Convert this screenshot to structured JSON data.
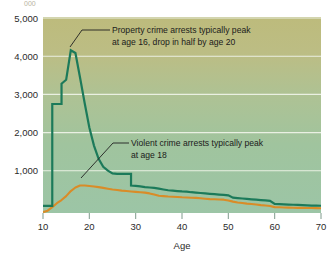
{
  "chart_data": {
    "type": "line",
    "title": "",
    "xlabel": "Age",
    "ylabel": "",
    "xlim": [
      10,
      70
    ],
    "ylim": [
      0,
      5000
    ],
    "grid": true,
    "legend": "none",
    "x_ticks": [
      "10",
      "20",
      "30",
      "40",
      "50",
      "60",
      "70"
    ],
    "y_ticks": [
      "1,000",
      "2,000",
      "3,000",
      "4,000",
      "5,000"
    ],
    "series": [
      {
        "name": "Property crime arrests",
        "color": "#1c7a5a",
        "x": [
          10,
          11,
          12,
          12,
          13,
          14,
          14,
          15,
          16,
          17,
          18,
          19,
          20,
          21,
          22,
          23,
          24,
          25,
          26,
          27,
          28,
          29,
          29,
          30,
          31,
          32,
          33,
          34,
          35,
          36,
          37,
          38,
          39,
          40,
          41,
          42,
          43,
          44,
          45,
          46,
          47,
          48,
          49,
          50,
          51,
          52,
          53,
          54,
          55,
          56,
          57,
          58,
          59,
          60,
          61,
          62,
          63,
          64,
          65,
          66,
          67,
          68,
          69,
          70
        ],
        "values": [
          180,
          180,
          180,
          2780,
          2780,
          2780,
          3300,
          3400,
          4150,
          4080,
          3450,
          2800,
          2180,
          1720,
          1380,
          1180,
          1080,
          1010,
          1000,
          1000,
          1000,
          1000,
          700,
          690,
          680,
          660,
          650,
          640,
          620,
          600,
          580,
          570,
          560,
          550,
          545,
          530,
          520,
          510,
          500,
          490,
          480,
          470,
          460,
          450,
          390,
          380,
          370,
          360,
          350,
          340,
          330,
          320,
          310,
          230,
          225,
          220,
          215,
          210,
          205,
          200,
          195,
          190,
          188,
          185
        ],
        "annotation": "Property crime arrests typically peak at age 16, drop in half by age 20"
      },
      {
        "name": "Violent crime arrests",
        "color": "#d98c28",
        "x": [
          10,
          11,
          12,
          13,
          14,
          15,
          16,
          17,
          18,
          19,
          20,
          21,
          22,
          23,
          24,
          25,
          26,
          27,
          28,
          29,
          30,
          31,
          32,
          33,
          34,
          35,
          36,
          37,
          38,
          39,
          40,
          41,
          42,
          43,
          44,
          45,
          46,
          47,
          48,
          49,
          50,
          51,
          52,
          53,
          54,
          55,
          56,
          57,
          58,
          59,
          60,
          61,
          62,
          63,
          64,
          65,
          66,
          67,
          68,
          69,
          70
        ],
        "values": [
          20,
          60,
          150,
          250,
          330,
          430,
          560,
          650,
          700,
          700,
          690,
          675,
          660,
          640,
          620,
          600,
          585,
          570,
          560,
          550,
          540,
          530,
          520,
          500,
          470,
          440,
          430,
          420,
          415,
          410,
          400,
          395,
          390,
          385,
          375,
          365,
          355,
          350,
          345,
          340,
          320,
          290,
          270,
          255,
          240,
          230,
          215,
          200,
          190,
          180,
          150,
          145,
          140,
          138,
          135,
          132,
          130,
          128,
          126,
          124,
          122
        ],
        "annotation": "Violent crime arrests typically peak at age 18"
      }
    ],
    "annotations": [
      {
        "id": "property-annotation",
        "line1": "Property crime arrests typically peak",
        "line2": "at age 16, drop in half by age 20",
        "points_to_age": 16,
        "points_to_value": 4150
      },
      {
        "id": "violent-annotation",
        "line1": "Violent crime arrests typically peak",
        "line2": "at age 18",
        "points_to_age": 18,
        "points_to_value": 700
      }
    ],
    "colors": {
      "property_line": "#1c7a5a",
      "violent_line": "#d98c28",
      "plot_bg_top": "#bfbd7f",
      "plot_bg_bottom": "#9cc4a4",
      "gridline": "#eef2e6",
      "page_bg": "#ffffff",
      "text": "#1b1b1b"
    },
    "ghost_text_top": "000"
  }
}
